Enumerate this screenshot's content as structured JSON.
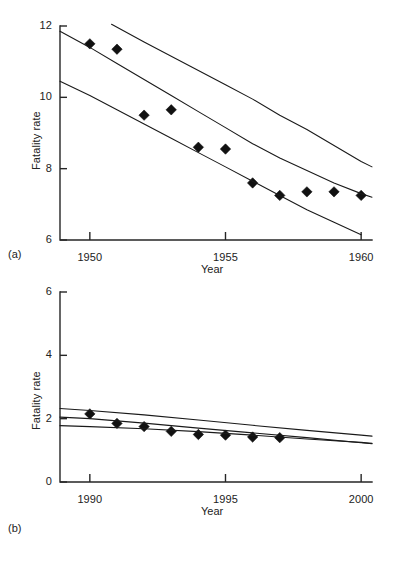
{
  "figure": {
    "panel_a_tag": "(a)",
    "panel_b_tag": "(b)"
  },
  "chart_data": [
    {
      "id": "panel-a",
      "type": "scatter",
      "title": "",
      "panel_label": "(a)",
      "xlabel": "Year",
      "ylabel": "Fatality rate",
      "xlim": [
        1948.9,
        1960.4
      ],
      "ylim": [
        6,
        12
      ],
      "xticks": [
        1950,
        1955,
        1960
      ],
      "xtick_labels": [
        "1950",
        "1955",
        "1960"
      ],
      "yticks": [
        6,
        8,
        10,
        12
      ],
      "ytick_labels": [
        "6",
        "8",
        "10",
        "12"
      ],
      "grid": false,
      "legend": "none",
      "marker": "filled-diamond",
      "series": [
        {
          "name": "Observed fatality rate",
          "type": "scatter",
          "x": [
            1950,
            1951,
            1952,
            1953,
            1954,
            1955,
            1956,
            1957,
            1958,
            1959,
            1960
          ],
          "values": [
            11.5,
            11.35,
            9.5,
            9.65,
            8.6,
            8.55,
            7.6,
            7.25,
            7.35,
            7.35,
            7.25
          ]
        },
        {
          "name": "Upper band",
          "type": "line",
          "x": [
            1950.8,
            1952,
            1953,
            1954,
            1955,
            1956,
            1957,
            1958,
            1959,
            1960,
            1960.4
          ],
          "values": [
            12.05,
            11.55,
            11.15,
            10.75,
            10.35,
            9.95,
            9.5,
            9.1,
            8.65,
            8.2,
            8.05
          ]
        },
        {
          "name": "Middle band",
          "type": "line",
          "x": [
            1948.9,
            1950,
            1951,
            1952,
            1953,
            1954,
            1955,
            1956,
            1957,
            1958,
            1959,
            1960,
            1960.4
          ],
          "values": [
            11.85,
            11.4,
            10.95,
            10.5,
            10.05,
            9.6,
            9.15,
            8.7,
            8.3,
            7.95,
            7.6,
            7.3,
            7.2
          ]
        },
        {
          "name": "Lower band",
          "type": "line",
          "x": [
            1948.9,
            1950,
            1951,
            1952,
            1953,
            1954,
            1955,
            1956,
            1957,
            1958,
            1959,
            1960
          ],
          "values": [
            10.45,
            10.05,
            9.65,
            9.25,
            8.85,
            8.45,
            8.05,
            7.65,
            7.25,
            6.85,
            6.5,
            6.15
          ]
        }
      ]
    },
    {
      "id": "panel-b",
      "type": "scatter",
      "title": "",
      "panel_label": "(b)",
      "xlabel": "Year",
      "ylabel": "Fatality rate",
      "xlim": [
        1988.9,
        2000.4
      ],
      "ylim": [
        0,
        6
      ],
      "xticks": [
        1990,
        1995,
        2000
      ],
      "xtick_labels": [
        "1990",
        "1995",
        "2000"
      ],
      "yticks": [
        0,
        2,
        4,
        6
      ],
      "ytick_labels": [
        "0",
        "2",
        "4",
        "6"
      ],
      "grid": false,
      "legend": "none",
      "marker": "filled-diamond",
      "series": [
        {
          "name": "Observed fatality rate",
          "type": "scatter",
          "x": [
            1990,
            1991,
            1992,
            1993,
            1994,
            1995,
            1996,
            1997
          ],
          "values": [
            2.15,
            1.85,
            1.75,
            1.6,
            1.5,
            1.48,
            1.42,
            1.4
          ]
        },
        {
          "name": "Upper band",
          "type": "line",
          "x": [
            1988.9,
            1990,
            1992,
            1994,
            1996,
            1998,
            2000,
            2000.4
          ],
          "values": [
            2.32,
            2.26,
            2.12,
            1.96,
            1.79,
            1.63,
            1.48,
            1.45
          ]
        },
        {
          "name": "Middle band",
          "type": "line",
          "x": [
            1988.9,
            1990,
            1992,
            1994,
            1996,
            1998,
            2000,
            2000.4
          ],
          "values": [
            2.05,
            2.0,
            1.86,
            1.7,
            1.55,
            1.4,
            1.24,
            1.21
          ]
        },
        {
          "name": "Lower band",
          "type": "line",
          "x": [
            1988.9,
            1990,
            1992,
            1994,
            1996,
            1998,
            2000,
            2000.4
          ],
          "values": [
            1.78,
            1.75,
            1.68,
            1.59,
            1.48,
            1.36,
            1.25,
            1.22
          ]
        }
      ]
    }
  ]
}
